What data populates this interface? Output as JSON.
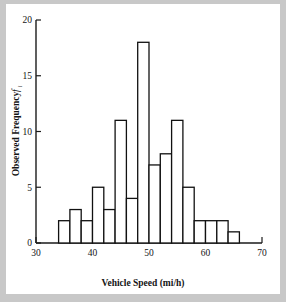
{
  "chart_data": {
    "type": "bar",
    "title": "",
    "subtitle": "",
    "xlabel": "Vehicle Speed (mi/h)",
    "ylabel": "Observed Frequency",
    "ylabel_symbol": "f",
    "ylabel_symbol_sub": "i",
    "xlim": [
      30,
      70
    ],
    "ylim": [
      0,
      20
    ],
    "xticks": [
      30,
      40,
      50,
      60,
      70
    ],
    "xtick_labels": [
      "30",
      "40",
      "50",
      "60",
      "70"
    ],
    "yticks": [
      0,
      5,
      10,
      15,
      20
    ],
    "ytick_labels": [
      "0",
      "5",
      "10",
      "15",
      "20"
    ],
    "grid": false,
    "legend": null,
    "bin_width": 2,
    "bin_edges": [
      34,
      36,
      38,
      40,
      42,
      44,
      46,
      48,
      50,
      52,
      54,
      56,
      58,
      60,
      62,
      64,
      66
    ],
    "categories": [
      "34-36",
      "36-38",
      "38-40",
      "40-42",
      "42-44",
      "44-46",
      "46-48",
      "48-50",
      "50-52",
      "52-54",
      "54-56",
      "56-58",
      "58-60",
      "60-62",
      "62-64",
      "64-66"
    ],
    "values": [
      2,
      3,
      2,
      5,
      3,
      11,
      4,
      18,
      7,
      8,
      11,
      5,
      2,
      2,
      2,
      1
    ],
    "bar_fill": "#ffffff",
    "bar_stroke": "#111111",
    "background": "#ffffff",
    "page_background": "#c8c8c8"
  }
}
